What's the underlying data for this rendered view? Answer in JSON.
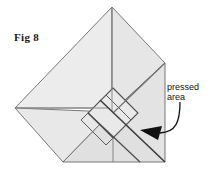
{
  "figure": {
    "label": "Fig 8",
    "callout": {
      "line1": "pressed",
      "line2": "area"
    },
    "colors": {
      "paper_light": "#ececec",
      "paper_mid": "#e3e3e3",
      "paper_dark": "#dcdcdc",
      "crease_light": "#8a8a8a",
      "crease_dark": "#4a4a4a",
      "outline": "#5a5a5a",
      "arrow": "#111111",
      "background": "#ffffff",
      "text": "#111111"
    },
    "geometry": {
      "apex": [
        112,
        7
      ],
      "left_vertex": [
        15,
        108
      ],
      "right_vertex": [
        165,
        63
      ],
      "bottom_left": [
        63,
        162
      ],
      "bottom_right": [
        165,
        162
      ],
      "center": [
        112,
        112
      ],
      "diamond_top": [
        113,
        88
      ],
      "diamond_left": [
        88,
        113
      ],
      "diamond_right": [
        138,
        113
      ],
      "diamond_bottom": [
        113,
        138
      ]
    }
  }
}
